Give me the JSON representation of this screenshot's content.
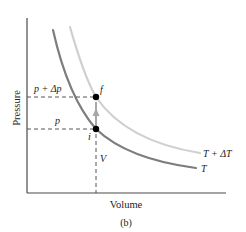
{
  "figure": {
    "panel_label": "(b)",
    "x_axis_label": "Volume",
    "y_axis_label": "Pressure",
    "curves": [
      {
        "name": "T",
        "label": "T",
        "color": "#7d7d7d",
        "description": "isotherm at temperature T"
      },
      {
        "name": "T+dT",
        "label": "T + ΔT",
        "color": "#cfcfcf",
        "description": "isotherm at temperature T + ΔT"
      }
    ],
    "points": [
      {
        "id": "i",
        "label": "i",
        "on_curve": "T",
        "pressure_label": "p"
      },
      {
        "id": "f",
        "label": "f",
        "on_curve": "T+dT",
        "pressure_label": "p + Δp"
      }
    ],
    "volume_marker_label": "V",
    "pressure_labels": {
      "initial": "p",
      "final": "p + Δp"
    },
    "process_arrow": {
      "from": "i",
      "to": "f",
      "color": "#a8a8a8",
      "description": "constant-volume process"
    }
  },
  "colors": {
    "axis": "#4a4a4a",
    "curve_T": "#7d7d7d",
    "curve_T_plus_dT": "#cfcfcf",
    "dashed": "#555555",
    "arrow": "#a8a8a8",
    "point": "#000000",
    "text": "#222222"
  }
}
